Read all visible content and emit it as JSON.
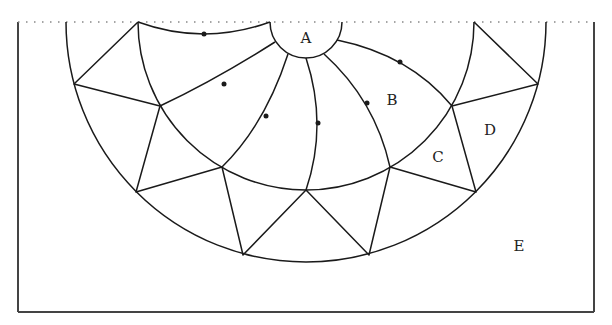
{
  "diagram": {
    "width": 612,
    "height": 325,
    "colors": {
      "stroke": "#1a1a1a",
      "frame": "#444444",
      "dotted": "#888888",
      "background": "#ffffff"
    },
    "frame": {
      "left": 18,
      "top": 22,
      "right": 594,
      "bottom": 312
    },
    "center": {
      "x": 306,
      "y": 22
    },
    "circle_A_radius": 36,
    "middle_arc_radius": 168,
    "outer_arc_radius": 240,
    "labels": {
      "A": "A",
      "B": "B",
      "C": "C",
      "D": "D",
      "E": "E"
    },
    "label_positions": {
      "A": [
        306,
        43
      ],
      "B": [
        392,
        105
      ],
      "C": [
        438,
        162
      ],
      "D": [
        490,
        135
      ],
      "E": [
        519,
        251
      ]
    },
    "spiral_dots": [
      [
        204,
        34
      ],
      [
        224,
        84
      ],
      [
        266,
        116
      ],
      [
        318,
        123
      ],
      [
        367,
        103
      ],
      [
        400,
        62
      ]
    ],
    "middle_vertices": [
      [
        138,
        22
      ],
      [
        160,
        106
      ],
      [
        222,
        167
      ],
      [
        306,
        190
      ],
      [
        390,
        167
      ],
      [
        452,
        106
      ],
      [
        474,
        22
      ]
    ],
    "outer_vertices": [
      [
        74,
        84
      ],
      [
        136,
        192
      ],
      [
        243,
        255
      ],
      [
        369,
        255
      ],
      [
        476,
        192
      ],
      [
        538,
        84
      ]
    ]
  }
}
